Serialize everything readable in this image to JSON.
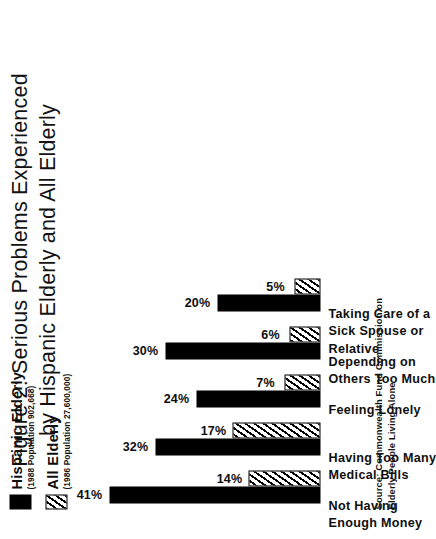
{
  "figure": {
    "title": "Figure 2:  Serious Problems Experienced\nby Hispanic Elderly and All Elderly",
    "source_note": "Source:  Commonwealth Fund Commission on\nElderly People Living Alone"
  },
  "legend": {
    "entries": [
      {
        "name": "Hispanic Elderly",
        "sub": "(1988 Population 902,668)",
        "swatch": "solid-black-swatch"
      },
      {
        "name": "All Elderly",
        "sub": "(1986 Population 27,600,000)",
        "swatch": "diagonal-hatch-swatch"
      }
    ]
  },
  "chart_data": {
    "type": "bar",
    "title": "Figure 2:  Serious Problems Experienced by Hispanic Elderly and All Elderly",
    "xlabel": "",
    "ylabel": "",
    "ylim": [
      0,
      45
    ],
    "grid": false,
    "orientation": "vertical",
    "legend_position": "right",
    "categories": [
      "Not Having\nEnough Money",
      "Having Too Many\nMedical Bills",
      "Feeling Lonely",
      "Depending on\nOthers Too Much",
      "Taking Care of a\nSick Spouse or\nRelative"
    ],
    "series": [
      {
        "name": "Hispanic Elderly",
        "values": [
          41,
          32,
          24,
          30,
          20
        ],
        "labels": [
          "41%",
          "32%",
          "24%",
          "30%",
          "20%"
        ]
      },
      {
        "name": "All Elderly",
        "values": [
          14,
          17,
          7,
          6,
          5
        ],
        "labels": [
          "14%",
          "17%",
          "7%",
          "6%",
          "5%"
        ]
      }
    ]
  }
}
